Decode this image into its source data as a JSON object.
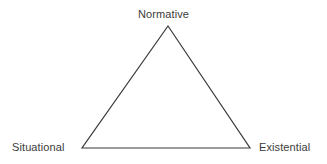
{
  "diagram": {
    "type": "triangle",
    "background_color": "#ffffff",
    "stroke_color": "#3a3a3a",
    "stroke_width": 1.2,
    "text_color": "#3b3b3b",
    "vertices": [
      {
        "id": "apex",
        "label": "Normative",
        "x": 168,
        "y": 26,
        "label_position": "top"
      },
      {
        "id": "bottom-left",
        "label": "Situational",
        "x": 82,
        "y": 148,
        "label_position": "left"
      },
      {
        "id": "bottom-right",
        "label": "Existential",
        "x": 250,
        "y": 148,
        "label_position": "right"
      }
    ]
  }
}
